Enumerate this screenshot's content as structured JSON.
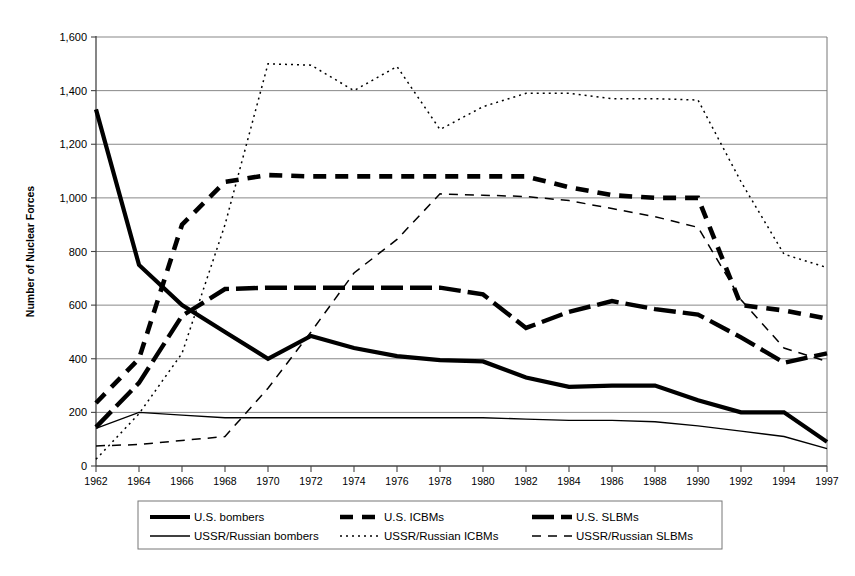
{
  "chart_data": {
    "type": "line",
    "title": "",
    "xlabel": "",
    "ylabel": "Number of Nuclear Forces",
    "ylim": [
      0,
      1600
    ],
    "yticks": [
      0,
      200,
      400,
      600,
      800,
      1000,
      1200,
      1400,
      1600
    ],
    "ytick_labels": [
      "0",
      "200",
      "400",
      "600",
      "800",
      "1,000",
      "1,200",
      "1,400",
      "1,600"
    ],
    "grid": true,
    "legend_position": "bottom",
    "categories": [
      1962,
      1964,
      1966,
      1968,
      1970,
      1972,
      1974,
      1976,
      1978,
      1980,
      1982,
      1984,
      1986,
      1988,
      1990,
      1992,
      1994,
      1997
    ],
    "xtick_labels": [
      "1962",
      "1964",
      "1966",
      "1968",
      "1970",
      "1972",
      "1974",
      "1976",
      "1978",
      "1980",
      "1982",
      "1984",
      "1986",
      "1988",
      "1990",
      "1992",
      "1994",
      "1997"
    ],
    "series": [
      {
        "name": "U.S. bombers",
        "style": "thick-solid",
        "color": "#000000",
        "values": [
          1330,
          750,
          600,
          500,
          400,
          485,
          440,
          410,
          395,
          390,
          330,
          295,
          300,
          300,
          245,
          200,
          200,
          90
        ]
      },
      {
        "name": "U.S. ICBMs",
        "style": "thick-dash",
        "color": "#000000",
        "values": [
          235,
          400,
          900,
          1060,
          1085,
          1080,
          1080,
          1080,
          1080,
          1080,
          1080,
          1040,
          1010,
          1000,
          1000,
          600,
          580,
          550
        ]
      },
      {
        "name": "U.S. SLBMs",
        "style": "thick-longdash",
        "color": "#000000",
        "values": [
          145,
          310,
          560,
          660,
          665,
          665,
          665,
          665,
          665,
          640,
          515,
          575,
          615,
          585,
          565,
          480,
          385,
          420
        ]
      },
      {
        "name": "USSR/Russian bombers",
        "style": "thin-solid",
        "color": "#000000",
        "values": [
          140,
          200,
          190,
          180,
          180,
          180,
          180,
          180,
          180,
          180,
          175,
          170,
          170,
          165,
          150,
          130,
          110,
          65
        ]
      },
      {
        "name": "USSR/Russian ICBMs",
        "style": "dotted",
        "color": "#000000",
        "values": [
          25,
          195,
          420,
          900,
          1500,
          1495,
          1400,
          1490,
          1255,
          1340,
          1390,
          1390,
          1370,
          1370,
          1365,
          1060,
          790,
          740
        ]
      },
      {
        "name": "USSR/Russian SLBMs",
        "style": "thin-dash",
        "color": "#000000",
        "values": [
          75,
          80,
          95,
          110,
          290,
          500,
          720,
          845,
          1015,
          1010,
          1005,
          990,
          960,
          930,
          890,
          620,
          440,
          390
        ]
      }
    ]
  },
  "legend": {
    "entries": [
      {
        "label": "U.S. bombers",
        "swatch": "thick-solid"
      },
      {
        "label": "U.S. ICBMs",
        "swatch": "thick-dash"
      },
      {
        "label": "U.S. SLBMs",
        "swatch": "thick-longdash"
      },
      {
        "label": "USSR/Russian bombers",
        "swatch": "thin-solid"
      },
      {
        "label": "USSR/Russian ICBMs",
        "swatch": "dotted"
      },
      {
        "label": "USSR/Russian SLBMs",
        "swatch": "thin-dash"
      }
    ]
  }
}
